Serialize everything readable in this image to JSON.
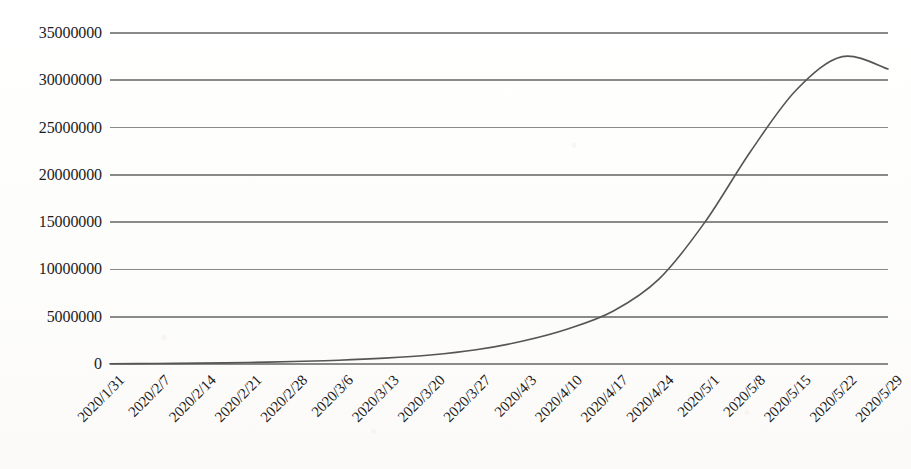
{
  "chart_data": {
    "type": "line",
    "title": "",
    "subtitle": "",
    "xlabel": "",
    "ylabel": "",
    "legend": [],
    "legend_position": "none",
    "grid": true,
    "grid_axis": "y",
    "ylim": [
      0,
      35000000
    ],
    "ytick_labels": [
      "35000000",
      "30000000",
      "25000000",
      "20000000",
      "15000000",
      "10000000",
      "5000000",
      "0"
    ],
    "ytick_values": [
      35000000,
      30000000,
      25000000,
      20000000,
      15000000,
      10000000,
      5000000,
      0
    ],
    "categories": [
      "2020/1/31",
      "2020/2/7",
      "2020/2/14",
      "2020/2/21",
      "2020/2/28",
      "2020/3/6",
      "2020/3/13",
      "2020/3/20",
      "2020/3/27",
      "2020/4/3",
      "2020/4/10",
      "2020/4/17",
      "2020/4/24",
      "2020/5/1",
      "2020/5/8",
      "2020/5/15",
      "2020/5/22",
      "2020/5/29"
    ],
    "series": [
      {
        "name": "cumulative",
        "color": "#555555",
        "values": [
          20000,
          45000,
          90000,
          160000,
          260000,
          400000,
          620000,
          950000,
          1500000,
          2400000,
          3700000,
          5600000,
          9000000,
          15000000,
          22500000,
          29000000,
          32500000,
          31200000
        ]
      }
    ],
    "peak": {
      "label": "2020/5/22",
      "value": 32500000
    },
    "end_value": 31200000,
    "grid_color": "#8a8a8a",
    "line_color": "#555555",
    "text_color": "#1c1c1c",
    "background_color": "#fdfdfc"
  }
}
